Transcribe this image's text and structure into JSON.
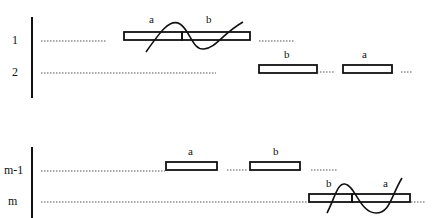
{
  "diagram": {
    "upper_group": {
      "rows": [
        {
          "label": "1",
          "segments": [
            {
              "name": "a"
            },
            {
              "name": "b"
            }
          ]
        },
        {
          "label": "2",
          "segments": [
            {
              "name": "b"
            },
            {
              "name": "a"
            }
          ]
        }
      ]
    },
    "lower_group": {
      "rows": [
        {
          "label": "m-1",
          "segments": [
            {
              "name": "a"
            },
            {
              "name": "b"
            }
          ]
        },
        {
          "label": "m",
          "segments": [
            {
              "name": "b"
            },
            {
              "name": "a"
            }
          ]
        }
      ]
    },
    "colors": {
      "ink": "#111111",
      "dotted": "#555555",
      "background": "#ffffff"
    }
  }
}
